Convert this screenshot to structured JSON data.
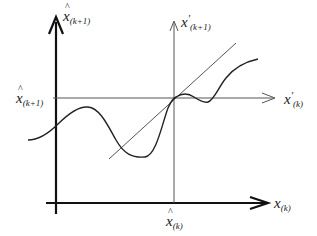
{
  "diagram": {
    "labels": {
      "y_axis_main": {
        "symbol": "x",
        "hat": true,
        "prime": false,
        "subscript": "(k+1)"
      },
      "y_axis_secondary": {
        "symbol": "x",
        "hat": false,
        "prime": true,
        "subscript": "(k+1)"
      },
      "x_axis_secondary": {
        "symbol": "x",
        "hat": false,
        "prime": true,
        "subscript": "(k)"
      },
      "x_axis_main": {
        "symbol": "x",
        "hat": false,
        "prime": false,
        "subscript": "(k)"
      },
      "y_tick": {
        "symbol": "x",
        "hat": true,
        "prime": false,
        "subscript": "(k+1)"
      },
      "x_tick": {
        "symbol": "x",
        "hat": true,
        "prime": false,
        "subscript": "(k)"
      }
    },
    "elements": [
      "main axes",
      "shifted axes through fixed point",
      "tangent line",
      "nonlinear curve"
    ],
    "colors": {
      "axis": "#111111",
      "thin_line": "#555555",
      "curve": "#222222"
    }
  }
}
